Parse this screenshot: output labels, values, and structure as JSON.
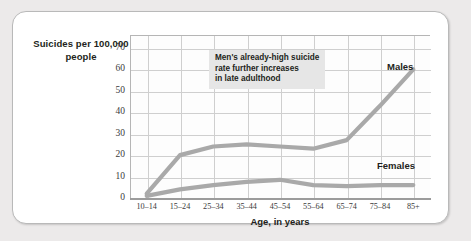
{
  "chart_data": {
    "type": "line",
    "title": "",
    "ylabel": "Suicides per 100,000 people",
    "xlabel": "Age, in years",
    "categories": [
      "10–14",
      "15–24",
      "25–34",
      "35–44",
      "45–54",
      "55–64",
      "65–74",
      "75–84",
      "85+"
    ],
    "yticks": [
      "0",
      "10",
      "20",
      "30",
      "40",
      "50",
      "60",
      "70"
    ],
    "ylim": [
      0,
      76
    ],
    "grid": true,
    "legend_position": "inline-labels",
    "series": [
      {
        "name": "Males",
        "values": [
          2,
          20,
          24,
          25,
          24,
          23,
          27,
          43,
          60
        ]
      },
      {
        "name": "Females",
        "values": [
          1,
          4,
          6,
          7.5,
          8.5,
          6,
          5.5,
          6,
          6
        ]
      }
    ],
    "annotations": [
      {
        "text": "Men's already-high suicide\nrate further increases\nin late adulthood"
      }
    ],
    "colors": {
      "line": "#a9a9a9",
      "grid": "#cfcfcf",
      "axis": "#9b9b9b",
      "text": "#231f20",
      "annotation_bg": "#e6e6e6"
    }
  }
}
